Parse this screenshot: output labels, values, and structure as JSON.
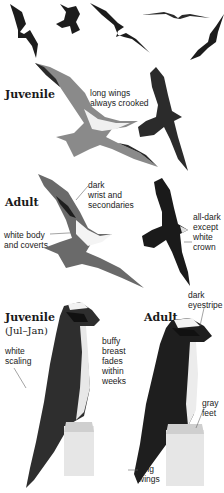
{
  "colors": {
    "background": "#ffffff",
    "ink": "#1a1a1a",
    "dark_plumage": "#1c1c1c",
    "mid_plumage": "#5a5a5a",
    "light_plumage": "#e8e8e8",
    "post": "#d8d8d8"
  },
  "silhouettes": {
    "count": 5,
    "icons": [
      "bird-silhouette-icon",
      "bird-silhouette-icon",
      "bird-silhouette-icon",
      "bird-silhouette-icon",
      "bird-silhouette-icon"
    ]
  },
  "flight_juvenile": {
    "heading": "Juvenile",
    "annotation": "long wings\nalways crooked"
  },
  "flight_adult": {
    "heading": "Adult",
    "annotations": {
      "wrist": "dark\nwrist and\nsecondaries",
      "body": "white body\nand coverts",
      "dark_morph": "all-dark\nexcept\nwhite\ncrown"
    }
  },
  "perched_juvenile": {
    "heading": "Juvenile",
    "subheading": "(Jul–Jan)",
    "annotations": {
      "scaling": "white\nscaling",
      "breast": "buffy breast\nfades within\nweeks"
    }
  },
  "perched_adult": {
    "heading": "Adult",
    "annotations": {
      "eyestripe": "dark\neyestripe",
      "feet": "gray\nfeet",
      "wings": "long\nwings"
    }
  }
}
